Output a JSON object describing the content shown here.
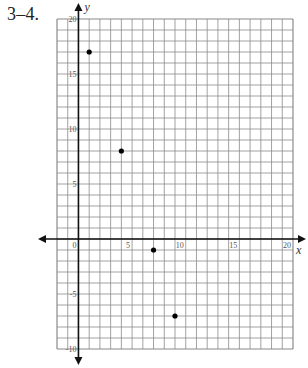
{
  "problem": {
    "label": "3–4."
  },
  "chart_data": {
    "type": "scatter",
    "title": "",
    "xlabel": "x",
    "ylabel": "y",
    "xlim": [
      -2,
      20
    ],
    "ylim": [
      -10,
      20
    ],
    "grid": true,
    "grid_step": 1,
    "x_ticks": [
      0,
      5,
      10,
      15,
      20
    ],
    "y_ticks": [
      -10,
      -5,
      5,
      10,
      15,
      20
    ],
    "x_tick_labels": [
      "0",
      "5",
      "10",
      "15",
      "20"
    ],
    "y_tick_labels": [
      "-10",
      "-5",
      "5",
      "10",
      "15",
      "20"
    ],
    "points": [
      {
        "x": 1,
        "y": 17
      },
      {
        "x": 4,
        "y": 8
      },
      {
        "x": 7,
        "y": -1
      },
      {
        "x": 9,
        "y": -7
      }
    ],
    "legend": null
  },
  "colors": {
    "grid": "#8a8a8a",
    "axis": "#111111",
    "point": "#000000"
  }
}
